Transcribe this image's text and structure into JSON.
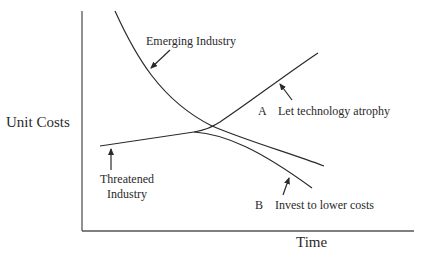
{
  "figure": {
    "top_cropped_text": "                    ",
    "axes": {
      "y_label": "Unit Costs",
      "x_label": "Time"
    },
    "curves": {
      "emerging": {
        "label": "Emerging Industry"
      },
      "threatened": {
        "label_line1": "Threatened",
        "label_line2": "Industry"
      },
      "option_a": {
        "key": "A",
        "label": "Let technology atrophy"
      },
      "option_b": {
        "key": "B",
        "label": "Invest to lower costs"
      }
    },
    "colors": {
      "ink": "#2a2a2a",
      "background": "#ffffff"
    }
  }
}
